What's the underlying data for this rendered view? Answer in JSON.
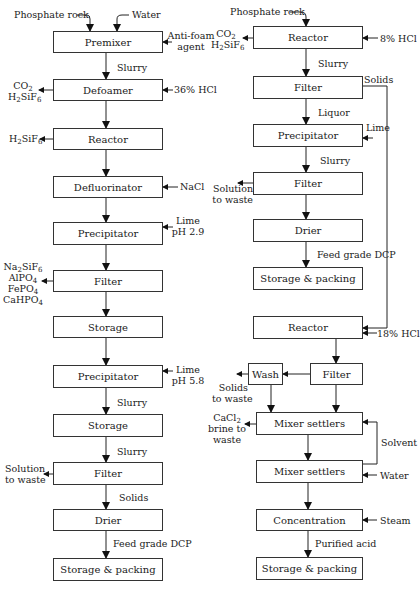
{
  "left_process": {
    "inputs": {
      "phosphate_rock": "Phosphate rock",
      "water": "Water"
    },
    "steps": [
      {
        "name": "Premixer",
        "side_in": "Anti-foam agent"
      },
      {
        "name": "Defoamer",
        "side_in": "36% HCl",
        "side_out": "CO2 H2SiF6",
        "in_label": "Slurry"
      },
      {
        "name": "Reactor",
        "side_out": "H2SiF6"
      },
      {
        "name": "Defluorinator",
        "side_in": "NaCl"
      },
      {
        "name": "Precipitator",
        "side_in": "Lime pH 2.9"
      },
      {
        "name": "Filter",
        "side_out": "Na2SiF6 AlPO4 FePO4 CaHPO4"
      },
      {
        "name": "Storage"
      },
      {
        "name": "Precipitator",
        "side_in": "Lime pH 5.8"
      },
      {
        "name": "Storage",
        "in_label": "Slurry"
      },
      {
        "name": "Filter",
        "in_label": "Slurry",
        "side_out": "Solution to waste"
      },
      {
        "name": "Drier",
        "in_label": "Solids"
      },
      {
        "name": "Storage & packing",
        "in_label": "Feed grade DCP"
      }
    ],
    "labels": {
      "anti_foam_1": "Anti-foam",
      "anti_foam_2": "agent",
      "slurry": "Slurry",
      "hcl36": "36% HCl",
      "nacl": "NaCl",
      "lime": "Lime",
      "ph29": "pH 2.9",
      "ph58": "pH 5.8",
      "sol_waste_1": "Solution",
      "sol_waste_2": "to waste",
      "solids": "Solids",
      "feed_dcp": "Feed grade DCP"
    }
  },
  "right_process": {
    "inputs": {
      "phosphate_rock": "Phosphate rock"
    },
    "steps": [
      {
        "name": "Reactor",
        "side_in": "8% HCl",
        "side_out": "CO2 H2SiF6"
      },
      {
        "name": "Filter",
        "in_label": "Slurry",
        "side_out": "Solids"
      },
      {
        "name": "Precipitator",
        "in_label": "Liquor",
        "side_in": "Lime"
      },
      {
        "name": "Filter",
        "in_label": "Slurry",
        "side_out": "Solution to waste"
      },
      {
        "name": "Drier"
      },
      {
        "name": "Storage & packing",
        "in_label": "Feed grade DCP"
      },
      {
        "name": "Reactor",
        "side_in": "18% HCl"
      },
      {
        "name": "Wash",
        "side_out": "Solids to waste"
      },
      {
        "name": "Filter"
      },
      {
        "name": "Mixer settlers",
        "side_out": "CaCl2 brine to waste"
      },
      {
        "name": "Mixer settlers",
        "side_in": "Water",
        "loop": "Solvent"
      },
      {
        "name": "Concentration",
        "side_in": "Steam"
      },
      {
        "name": "Storage & packing",
        "in_label": "Purified acid"
      }
    ],
    "labels": {
      "hcl8": "8% HCl",
      "slurry": "Slurry",
      "solids": "Solids",
      "liquor": "Liquor",
      "lime": "Lime",
      "sol_waste_1": "Solution",
      "sol_waste_2": "to waste",
      "feed_dcp": "Feed grade DCP",
      "hcl18": "18% HCl",
      "solids_waste_1": "Solids",
      "solids_waste_2": "to waste",
      "brine_2": "brine to",
      "brine_3": "waste",
      "solvent": "Solvent",
      "water": "Water",
      "steam": "Steam",
      "purified_acid": "Purified acid"
    }
  }
}
